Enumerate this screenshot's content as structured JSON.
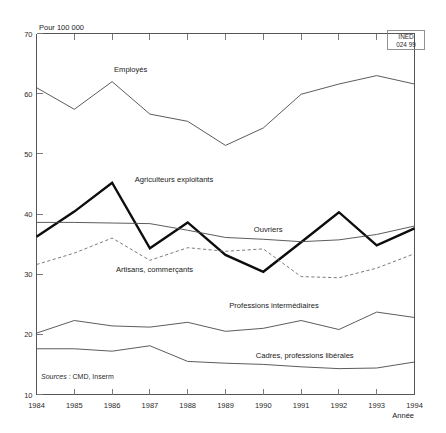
{
  "chart_data": {
    "type": "line",
    "title": "",
    "subtitle": "",
    "xlabel": "Année",
    "ylabel": "Pour 100 000",
    "x": [
      1984,
      1985,
      1986,
      1987,
      1988,
      1989,
      1990,
      1991,
      1992,
      1993,
      1994
    ],
    "categories": [
      "1984",
      "1985",
      "1986",
      "1987",
      "1988",
      "1989",
      "1990",
      "1991",
      "1992",
      "1993",
      "1994"
    ],
    "xlim": [
      1984,
      1994
    ],
    "ylim": [
      10,
      70
    ],
    "yticks": [
      10,
      20,
      30,
      40,
      50,
      60,
      70
    ],
    "ytick_labels": [
      "10",
      "20",
      "30",
      "40",
      "50",
      "60",
      "70"
    ],
    "grid": false,
    "legend_position": "inline-annotations",
    "series": [
      {
        "name": "Employés",
        "style": "thin",
        "label_x": 1986.05,
        "label_y": 63.6,
        "values": [
          61.0,
          57.4,
          62.0,
          56.6,
          55.4,
          51.4,
          54.3,
          59.9,
          61.6,
          63.0,
          61.6
        ]
      },
      {
        "name": "Agriculteurs exploitants",
        "style": "thick",
        "label_x": 1986.6,
        "label_y": 45.4,
        "values": [
          36.2,
          40.4,
          45.2,
          34.3,
          38.6,
          33.2,
          30.4,
          35.3,
          40.3,
          34.8,
          37.6
        ]
      },
      {
        "name": "Ouvriers",
        "style": "thin",
        "label_x": 1989.75,
        "label_y": 37.0,
        "values": [
          38.6,
          38.6,
          38.5,
          38.4,
          37.3,
          36.1,
          35.8,
          35.4,
          35.7,
          36.6,
          38.0
        ]
      },
      {
        "name": "Artisans, commerçants",
        "style": "dashed",
        "label_x": 1986.1,
        "label_y": 30.3,
        "values": [
          31.6,
          33.5,
          36.0,
          32.3,
          34.4,
          33.8,
          34.2,
          29.6,
          29.4,
          31.0,
          33.4
        ]
      },
      {
        "name": "Professions intermédiaires",
        "style": "thin",
        "label_x": 1989.1,
        "label_y": 24.3,
        "values": [
          20.2,
          22.3,
          21.4,
          21.2,
          22.0,
          20.5,
          21.0,
          22.3,
          20.8,
          23.7,
          22.8
        ]
      },
      {
        "name": "Cadres, professions libérales",
        "style": "thin",
        "label_x": 1989.8,
        "label_y": 16.1,
        "values": [
          17.6,
          17.6,
          17.2,
          18.1,
          15.5,
          15.2,
          15.0,
          14.6,
          14.3,
          14.4,
          15.4
        ]
      }
    ],
    "annotations": {
      "source": "Sources : CMD, Inserm",
      "source_prefix": "Sources",
      "source_rest": " : CMD, Inserm",
      "credit_line1": "INED",
      "credit_line2": "024 99"
    }
  },
  "axes": {
    "y_unit_label": "Pour 100 000",
    "x_unit_label": "Année"
  }
}
